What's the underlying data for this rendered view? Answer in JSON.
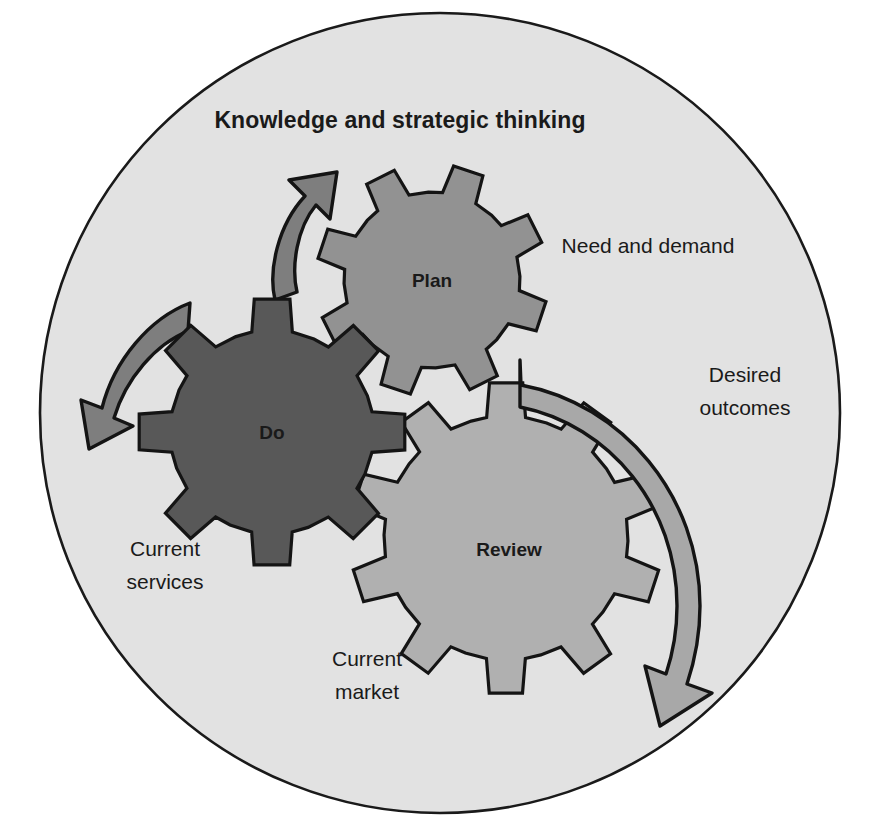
{
  "diagram": {
    "title": "Knowledge and strategic thinking",
    "container_shape": "circle",
    "colors": {
      "background": "#ffffff",
      "circle_fill": "#E2E2E2",
      "circle_stroke": "#1a1a1a",
      "gear_plan_fill": "#929292",
      "gear_do_fill": "#585858",
      "gear_review_fill": "#B0B0B0",
      "arrow_left_fill": "#7E7E7E",
      "arrow_right_fill": "#A8A8A8",
      "outline": "#141414",
      "text": "#1a1a1a"
    },
    "gears": [
      {
        "id": "plan",
        "label": "Plan",
        "teeth": 8,
        "fill": "#929292",
        "cx": 432,
        "cy": 280,
        "r_outer": 116,
        "r_inner": 88
      },
      {
        "id": "do",
        "label": "Do",
        "teeth": 8,
        "fill": "#585858",
        "cx": 272,
        "cy": 432,
        "r_outer": 134,
        "r_inner": 102
      },
      {
        "id": "review",
        "label": "Review",
        "teeth": 10,
        "fill": "#B0B0B0",
        "cx": 506,
        "cy": 538,
        "r_outer": 156,
        "r_inner": 122
      }
    ],
    "annotations": [
      {
        "id": "need-and-demand",
        "lines": [
          "Need and demand"
        ],
        "x": 648,
        "y": 246,
        "anchor": "middle"
      },
      {
        "id": "desired-outcomes",
        "lines": [
          "Desired",
          "outcomes"
        ],
        "x": 745,
        "y": 382,
        "anchor": "middle"
      },
      {
        "id": "current-services",
        "lines": [
          "Current",
          "services"
        ],
        "x": 165,
        "y": 552,
        "anchor": "middle"
      },
      {
        "id": "current-market",
        "lines": [
          "Current",
          "market"
        ],
        "x": 367,
        "y": 662,
        "anchor": "middle"
      }
    ],
    "arrows": [
      {
        "id": "arrow-up-left",
        "direction": "counter-clockwise-up",
        "head": "up",
        "fill": "#7E7E7E"
      },
      {
        "id": "arrow-down-left",
        "direction": "counter-clockwise-down",
        "head": "down-left",
        "fill": "#7E7E7E"
      },
      {
        "id": "arrow-right-arc",
        "direction": "clockwise",
        "head": "down-left",
        "fill": "#A8A8A8"
      }
    ]
  }
}
